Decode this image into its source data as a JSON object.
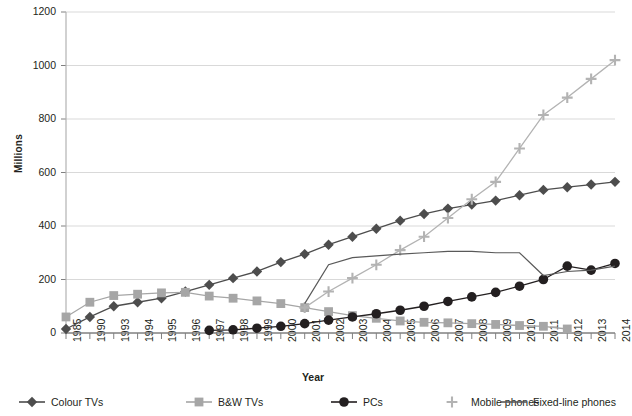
{
  "chart_data": {
    "type": "line",
    "title": "",
    "xlabel": "Year",
    "ylabel": "Millions",
    "ylim": [
      0,
      1200
    ],
    "yticks": [
      0,
      200,
      400,
      600,
      800,
      1000,
      1200
    ],
    "grid": true,
    "legend_position": "bottom",
    "categories": [
      "1985",
      "1990",
      "1993",
      "1994",
      "1995",
      "1996",
      "1997",
      "1998",
      "1999",
      "2000",
      "2001",
      "2002",
      "2003",
      "2004",
      "2005",
      "2006",
      "2007",
      "2008",
      "2009",
      "2010",
      "2011",
      "2012",
      "2013",
      "2014"
    ],
    "series": [
      {
        "name": "Colour TVs",
        "marker": "diamond",
        "color": "#4d4d4d",
        "values": [
          15,
          60,
          100,
          115,
          130,
          155,
          180,
          205,
          230,
          265,
          295,
          330,
          360,
          390,
          420,
          445,
          465,
          480,
          495,
          515,
          535,
          545,
          555,
          565
        ]
      },
      {
        "name": "B&W TVs",
        "marker": "square",
        "color": "#a6a6a6",
        "values": [
          60,
          115,
          140,
          145,
          150,
          152,
          138,
          130,
          120,
          110,
          95,
          80,
          65,
          55,
          45,
          40,
          38,
          35,
          32,
          28,
          25,
          15,
          null,
          null
        ]
      },
      {
        "name": "PCs",
        "marker": "circle",
        "color": "#231f20",
        "values": [
          null,
          null,
          null,
          null,
          null,
          null,
          10,
          12,
          18,
          25,
          35,
          48,
          60,
          72,
          85,
          100,
          118,
          135,
          152,
          175,
          200,
          250,
          235,
          260
        ]
      },
      {
        "name": "Mobile phones",
        "marker": "plus",
        "color": "#b3b3b3",
        "values": [
          null,
          null,
          null,
          null,
          null,
          null,
          null,
          null,
          null,
          null,
          95,
          155,
          205,
          255,
          310,
          360,
          430,
          500,
          565,
          690,
          815,
          880,
          950,
          1020
        ]
      },
      {
        "name": "Fixed-line phones",
        "marker": "line",
        "color": "#595959",
        "values": [
          null,
          null,
          null,
          null,
          null,
          null,
          null,
          null,
          null,
          null,
          110,
          255,
          282,
          288,
          295,
          300,
          305,
          305,
          300,
          300,
          215,
          230,
          235,
          250
        ]
      }
    ]
  },
  "axis": {
    "ylabel": "Millions",
    "xlabel": "Year",
    "yticks": [
      "0",
      "200",
      "400",
      "600",
      "800",
      "1000",
      "1200"
    ]
  },
  "legend": {
    "items": [
      {
        "label": "Colour TVs",
        "marker": "diamond-marker-icon"
      },
      {
        "label": "B&W TVs",
        "marker": "square-marker-icon"
      },
      {
        "label": "PCs",
        "marker": "circle-marker-icon"
      },
      {
        "label": "Mobile phones",
        "marker": "plus-marker-icon"
      },
      {
        "label": "Fixed-line phones",
        "marker": "line-marker-icon"
      }
    ]
  }
}
